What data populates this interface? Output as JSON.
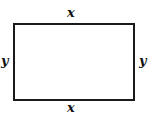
{
  "diagram": {
    "shape": "rectangle",
    "labels": {
      "top": "x",
      "bottom": "x",
      "left": "y",
      "right": "y"
    }
  }
}
